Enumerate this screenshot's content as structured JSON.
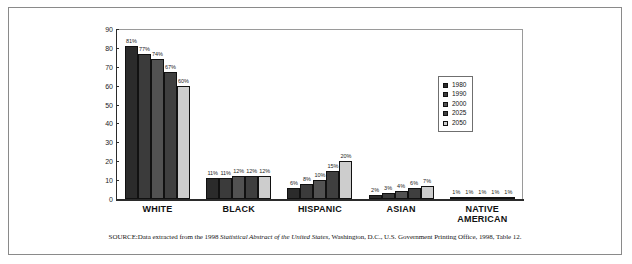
{
  "chart_data": {
    "type": "bar",
    "title": "",
    "xlabel": "",
    "ylabel": "",
    "ylim": [
      0,
      90
    ],
    "yticks": [
      0,
      10,
      20,
      30,
      40,
      50,
      60,
      70,
      80,
      90
    ],
    "grid": false,
    "legend_position": "right-inside",
    "categories": [
      "WHITE",
      "BLACK",
      "HISPANIC",
      "ASIAN",
      "NATIVE AMERICAN"
    ],
    "series": [
      {
        "name": "1980",
        "color": "#2b2b2b",
        "values": [
          81,
          11,
          6,
          2,
          1
        ],
        "labels": [
          "81%",
          "11%",
          "6%",
          "2%",
          "1%"
        ]
      },
      {
        "name": "1990",
        "color": "#3b3b3b",
        "values": [
          77,
          11,
          8,
          3,
          1
        ],
        "labels": [
          "77%",
          "11%",
          "8%",
          "3%",
          "1%"
        ]
      },
      {
        "name": "2000",
        "color": "#525252",
        "values": [
          74,
          12,
          10,
          4,
          1
        ],
        "labels": [
          "74%",
          "12%",
          "10%",
          "4%",
          "1%"
        ]
      },
      {
        "name": "2025",
        "color": "#3f3f3f",
        "values": [
          67,
          12,
          15,
          6,
          1
        ],
        "labels": [
          "67%",
          "12%",
          "15%",
          "6%",
          "1%"
        ]
      },
      {
        "name": "2050",
        "color": "#cdcdcd",
        "values": [
          60,
          12,
          20,
          7,
          1
        ],
        "labels": [
          "60%",
          "12%",
          "20%",
          "7%",
          "1%"
        ]
      }
    ]
  },
  "legend": {
    "items": [
      {
        "label": "1980"
      },
      {
        "label": "1990"
      },
      {
        "label": "2000"
      },
      {
        "label": "2025"
      },
      {
        "label": "2050"
      }
    ]
  },
  "source": {
    "prefix": "SOURCE:",
    "text_before": "Data extracted from the 1998 ",
    "italic_title": "Statistical Abstract of the United States",
    "text_after": ", Washington, D.C., U.S. Government Printing Office, 1998, Table 12."
  }
}
